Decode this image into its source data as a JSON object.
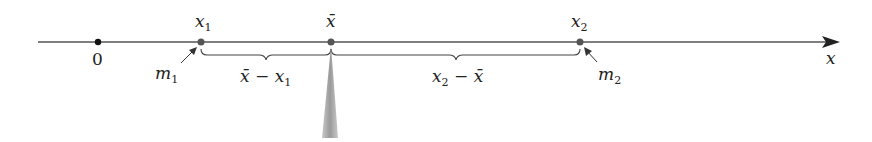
{
  "figure": {
    "axis_label": "x",
    "origin_label": "0",
    "points": [
      {
        "id": "x1",
        "var": "x",
        "sub": "1",
        "mass_var": "m",
        "mass_sub": "1"
      },
      {
        "id": "xbar",
        "var": "x̄"
      },
      {
        "id": "x2",
        "var": "x",
        "sub": "2",
        "mass_var": "m",
        "mass_sub": "2"
      }
    ],
    "braces": [
      {
        "label_a": "x̄",
        "op": " − ",
        "label_b": "x",
        "label_b_sub": "1"
      },
      {
        "label_a": "x",
        "label_a_sub": "2",
        "op": " − ",
        "label_b": "x̄"
      }
    ],
    "colors": {
      "line": "#555555",
      "dot": "#555555",
      "origin_dot": "#111111",
      "fulcrum": "#b0b0b0"
    }
  }
}
